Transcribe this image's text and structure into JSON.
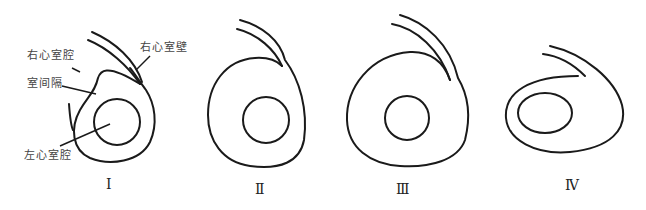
{
  "figure": {
    "panels": [
      {
        "numeral": "Ⅰ",
        "labels": {
          "rv_cavity": "右心室腔",
          "rv_wall": "右心室壁",
          "septum": "室间隔",
          "lv_cavity": "左心室腔"
        }
      },
      {
        "numeral": "Ⅱ"
      },
      {
        "numeral": "Ⅲ"
      },
      {
        "numeral": "Ⅳ"
      }
    ],
    "colors": {
      "line": "#1a1a1a",
      "text": "#444444",
      "background": "#ffffff"
    }
  }
}
